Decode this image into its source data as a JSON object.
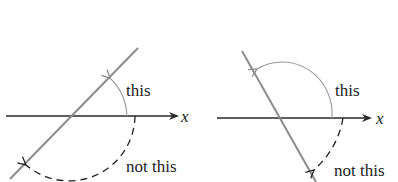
{
  "diagrams": [
    {
      "id": "left",
      "axis_label": "x",
      "correct_label": "this",
      "incorrect_label": "not this",
      "line_slope": "positive"
    },
    {
      "id": "right",
      "axis_label": "x",
      "correct_label": "this",
      "incorrect_label": "not this",
      "line_slope": "negative"
    }
  ],
  "colors": {
    "axis": "#2a2a2a",
    "line": "#8c8c8c",
    "correct_arc": "#9a9a9a",
    "incorrect_arc": "#222222",
    "text": "#222222"
  }
}
